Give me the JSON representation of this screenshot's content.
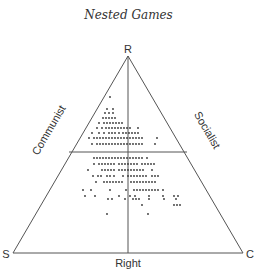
{
  "title": "Nested Games",
  "diagram": {
    "type": "ternary",
    "vertices": {
      "top": "R",
      "bottom_left": "S",
      "bottom_right": "C"
    },
    "edge_labels": {
      "left": "Communist",
      "right": "Socialist",
      "bottom": "Right"
    },
    "line_color": "#555555",
    "dot_color": "#333333"
  },
  "dots": [
    [
      110,
      97
    ],
    [
      107,
      109
    ],
    [
      113,
      109
    ],
    [
      105,
      113
    ],
    [
      109,
      113
    ],
    [
      113,
      113
    ],
    [
      103,
      118
    ],
    [
      106,
      118
    ],
    [
      109,
      118
    ],
    [
      112,
      118
    ],
    [
      115,
      118
    ],
    [
      99,
      123
    ],
    [
      104,
      123
    ],
    [
      107,
      123
    ],
    [
      110,
      123
    ],
    [
      113,
      123
    ],
    [
      116,
      123
    ],
    [
      119,
      123
    ],
    [
      122,
      123
    ],
    [
      97,
      128
    ],
    [
      102,
      128
    ],
    [
      106,
      128
    ],
    [
      109,
      128
    ],
    [
      112,
      128
    ],
    [
      115,
      128
    ],
    [
      118,
      128
    ],
    [
      121,
      128
    ],
    [
      124,
      128
    ],
    [
      127,
      128
    ],
    [
      130,
      128
    ],
    [
      138,
      128
    ],
    [
      92,
      133
    ],
    [
      99,
      133
    ],
    [
      104,
      133
    ],
    [
      109,
      133
    ],
    [
      112,
      133
    ],
    [
      115,
      133
    ],
    [
      119,
      133
    ],
    [
      123,
      133
    ],
    [
      126,
      133
    ],
    [
      129,
      133
    ],
    [
      132,
      133
    ],
    [
      135,
      133
    ],
    [
      138,
      133
    ],
    [
      89,
      138
    ],
    [
      94,
      138
    ],
    [
      97,
      138
    ],
    [
      100,
      138
    ],
    [
      103,
      138
    ],
    [
      106,
      138
    ],
    [
      109,
      138
    ],
    [
      112,
      138
    ],
    [
      115,
      138
    ],
    [
      118,
      138
    ],
    [
      121,
      138
    ],
    [
      124,
      138
    ],
    [
      127,
      138
    ],
    [
      130,
      138
    ],
    [
      133,
      138
    ],
    [
      136,
      138
    ],
    [
      139,
      138
    ],
    [
      142,
      138
    ],
    [
      157,
      138
    ],
    [
      92,
      144
    ],
    [
      97,
      144
    ],
    [
      100,
      144
    ],
    [
      103,
      144
    ],
    [
      106,
      144
    ],
    [
      109,
      144
    ],
    [
      112,
      144
    ],
    [
      115,
      144
    ],
    [
      118,
      144
    ],
    [
      121,
      144
    ],
    [
      124,
      144
    ],
    [
      127,
      144
    ],
    [
      130,
      144
    ],
    [
      133,
      144
    ],
    [
      136,
      144
    ],
    [
      139,
      144
    ],
    [
      142,
      144
    ],
    [
      155,
      144
    ],
    [
      94,
      158
    ],
    [
      97,
      158
    ],
    [
      100,
      158
    ],
    [
      103,
      158
    ],
    [
      106,
      158
    ],
    [
      109,
      158
    ],
    [
      112,
      158
    ],
    [
      115,
      158
    ],
    [
      118,
      158
    ],
    [
      121,
      158
    ],
    [
      124,
      158
    ],
    [
      127,
      158
    ],
    [
      130,
      158
    ],
    [
      133,
      158
    ],
    [
      136,
      158
    ],
    [
      139,
      158
    ],
    [
      142,
      158
    ],
    [
      147,
      158
    ],
    [
      94,
      164
    ],
    [
      99,
      164
    ],
    [
      102,
      164
    ],
    [
      105,
      164
    ],
    [
      108,
      164
    ],
    [
      111,
      164
    ],
    [
      114,
      164
    ],
    [
      119,
      164
    ],
    [
      122,
      164
    ],
    [
      125,
      164
    ],
    [
      128,
      164
    ],
    [
      131,
      164
    ],
    [
      134,
      164
    ],
    [
      137,
      164
    ],
    [
      142,
      164
    ],
    [
      145,
      164
    ],
    [
      148,
      164
    ],
    [
      151,
      164
    ],
    [
      154,
      164
    ],
    [
      88,
      170
    ],
    [
      102,
      170
    ],
    [
      105,
      170
    ],
    [
      108,
      170
    ],
    [
      111,
      170
    ],
    [
      114,
      170
    ],
    [
      119,
      170
    ],
    [
      122,
      170
    ],
    [
      125,
      170
    ],
    [
      128,
      170
    ],
    [
      131,
      170
    ],
    [
      134,
      170
    ],
    [
      137,
      170
    ],
    [
      140,
      170
    ],
    [
      143,
      170
    ],
    [
      152,
      170
    ],
    [
      93,
      176
    ],
    [
      98,
      176
    ],
    [
      101,
      176
    ],
    [
      107,
      176
    ],
    [
      110,
      176
    ],
    [
      114,
      176
    ],
    [
      123,
      176
    ],
    [
      128,
      176
    ],
    [
      131,
      176
    ],
    [
      134,
      176
    ],
    [
      137,
      176
    ],
    [
      140,
      176
    ],
    [
      143,
      176
    ],
    [
      146,
      176
    ],
    [
      152,
      176
    ],
    [
      155,
      176
    ],
    [
      158,
      176
    ],
    [
      96,
      182
    ],
    [
      104,
      182
    ],
    [
      107,
      182
    ],
    [
      110,
      182
    ],
    [
      113,
      182
    ],
    [
      116,
      182
    ],
    [
      119,
      182
    ],
    [
      122,
      182
    ],
    [
      131,
      182
    ],
    [
      134,
      182
    ],
    [
      137,
      182
    ],
    [
      140,
      182
    ],
    [
      143,
      182
    ],
    [
      146,
      182
    ],
    [
      149,
      182
    ],
    [
      152,
      182
    ],
    [
      155,
      182
    ],
    [
      83,
      190
    ],
    [
      91,
      190
    ],
    [
      110,
      190
    ],
    [
      126,
      190
    ],
    [
      134,
      190
    ],
    [
      137,
      190
    ],
    [
      140,
      190
    ],
    [
      143,
      190
    ],
    [
      146,
      190
    ],
    [
      149,
      190
    ],
    [
      152,
      190
    ],
    [
      155,
      190
    ],
    [
      158,
      190
    ],
    [
      163,
      190
    ],
    [
      85,
      196
    ],
    [
      95,
      196
    ],
    [
      119,
      196
    ],
    [
      130,
      196
    ],
    [
      135,
      196
    ],
    [
      149,
      196
    ],
    [
      163,
      196
    ],
    [
      174,
      196
    ],
    [
      178,
      196
    ],
    [
      108,
      199
    ],
    [
      112,
      199
    ],
    [
      125,
      199
    ],
    [
      133,
      199
    ],
    [
      136,
      199
    ],
    [
      139,
      199
    ],
    [
      149,
      199
    ],
    [
      164,
      199
    ],
    [
      176,
      199
    ],
    [
      142,
      205
    ],
    [
      174,
      205
    ],
    [
      177,
      205
    ],
    [
      180,
      205
    ],
    [
      107,
      214
    ],
    [
      148,
      214
    ]
  ]
}
